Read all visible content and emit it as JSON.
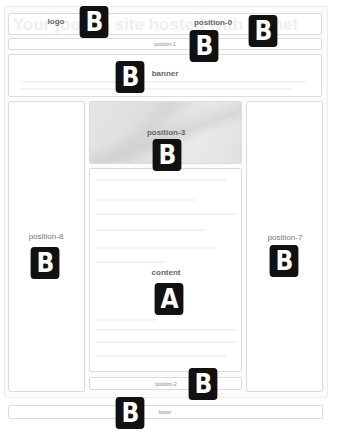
{
  "header": {
    "ghost_title": "Your joomla site hosted with us.net",
    "logo_label": "logo",
    "position0_label": "position-0"
  },
  "nav": {
    "position1_label": "position-1"
  },
  "banner": {
    "label": "banner"
  },
  "left_column": {
    "label": "position-8"
  },
  "right_column": {
    "label": "position-7"
  },
  "center": {
    "position3_label": "position-3",
    "content_label": "content",
    "position2_label": "position-2"
  },
  "footer": {
    "label": "footer"
  },
  "badges": {
    "logo": "B",
    "position0": "B",
    "position1": "B",
    "banner": "B",
    "position3": "B",
    "content": "A",
    "position8": "B",
    "position7": "B",
    "position2": "B",
    "footer": "B"
  },
  "colors": {
    "badge_bg": "#111111",
    "badge_text": "#ffffff",
    "border": "#dcdcdc",
    "label": "#666666"
  }
}
